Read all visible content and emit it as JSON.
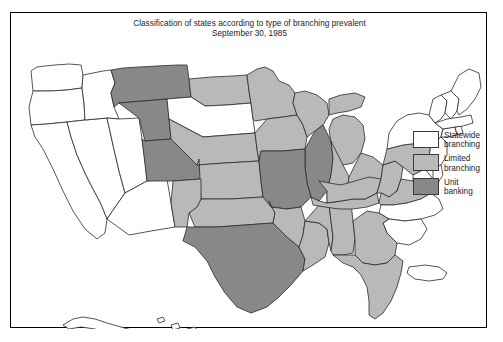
{
  "figure": {
    "title_line1": "Classification of states according to type of branching prevalent",
    "title_line2": "September 30, 1985",
    "frame_color": "#000000",
    "background": "#ffffff"
  },
  "legend": {
    "items": [
      {
        "label_line1": "Statewide",
        "label_line2": "branching",
        "color": "#ffffff",
        "key": "statewide"
      },
      {
        "label_line1": "Limited",
        "label_line2": "branching",
        "color": "#b9b9b9",
        "key": "limited"
      },
      {
        "label_line1": "Unit",
        "label_line2": "banking",
        "color": "#888888",
        "key": "unit"
      }
    ]
  },
  "map": {
    "type": "choropleth",
    "region": "United States",
    "outline_color": "#2b2b2b",
    "categories": {
      "statewide": {
        "fill": "#ffffff",
        "name": "Statewide branching"
      },
      "limited": {
        "fill": "#b9b9b9",
        "name": "Limited branching"
      },
      "unit": {
        "fill": "#888888",
        "name": "Unit banking"
      }
    },
    "states": {
      "WA": "statewide",
      "OR": "statewide",
      "CA": "statewide",
      "NV": "statewide",
      "ID": "statewide",
      "UT": "statewide",
      "AZ": "statewide",
      "SD": "statewide",
      "MT": "unit",
      "WY": "unit",
      "CO": "unit",
      "TX": "unit",
      "MO": "unit",
      "IL": "unit",
      "ND": "limited",
      "NE": "limited",
      "KS": "limited",
      "OK": "limited",
      "NM": "limited",
      "MN": "limited",
      "IA": "limited",
      "WI": "limited",
      "MI": "limited",
      "IN": "limited",
      "OH": "limited",
      "PA": "limited",
      "WV": "limited",
      "VA": "limited",
      "KY": "limited",
      "TN": "limited",
      "AR": "limited",
      "LA": "limited",
      "MS": "limited",
      "AL": "limited",
      "GA": "limited",
      "FL": "limited",
      "NC": "statewide",
      "SC": "statewide",
      "NY": "statewide",
      "NJ": "statewide",
      "DE": "statewide",
      "MD": "statewide",
      "CT": "statewide",
      "RI": "statewide",
      "MA": "statewide",
      "VT": "statewide",
      "NH": "statewide",
      "ME": "statewide",
      "AK": "statewide",
      "HI": "statewide",
      "PR": "statewide"
    },
    "insets": [
      "Alaska",
      "Hawaii",
      "Puerto Rico"
    ]
  }
}
